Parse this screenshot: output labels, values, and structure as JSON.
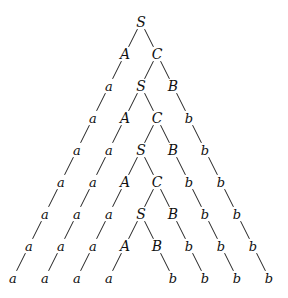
{
  "diagram": {
    "type": "parse-tree",
    "nodes": [
      {
        "id": "n0",
        "label": "S",
        "row": 0,
        "col": 0
      },
      {
        "id": "n1",
        "label": "A",
        "row": 1,
        "col": -1
      },
      {
        "id": "n2",
        "label": "C",
        "row": 1,
        "col": 1
      },
      {
        "id": "n3",
        "label": "a",
        "row": 2,
        "col": -2
      },
      {
        "id": "n4",
        "label": "S",
        "row": 2,
        "col": 0
      },
      {
        "id": "n5",
        "label": "B",
        "row": 2,
        "col": 2
      },
      {
        "id": "n6",
        "label": "a",
        "row": 3,
        "col": -3
      },
      {
        "id": "n7",
        "label": "A",
        "row": 3,
        "col": -1
      },
      {
        "id": "n8",
        "label": "C",
        "row": 3,
        "col": 1
      },
      {
        "id": "n9",
        "label": "b",
        "row": 3,
        "col": 3
      },
      {
        "id": "n10",
        "label": "a",
        "row": 4,
        "col": -4
      },
      {
        "id": "n11",
        "label": "a",
        "row": 4,
        "col": -2
      },
      {
        "id": "n12",
        "label": "S",
        "row": 4,
        "col": 0
      },
      {
        "id": "n13",
        "label": "B",
        "row": 4,
        "col": 2
      },
      {
        "id": "n14",
        "label": "b",
        "row": 4,
        "col": 4
      },
      {
        "id": "n15",
        "label": "a",
        "row": 5,
        "col": -5
      },
      {
        "id": "n16",
        "label": "a",
        "row": 5,
        "col": -3
      },
      {
        "id": "n17",
        "label": "A",
        "row": 5,
        "col": -1
      },
      {
        "id": "n18",
        "label": "C",
        "row": 5,
        "col": 1
      },
      {
        "id": "n19",
        "label": "b",
        "row": 5,
        "col": 3
      },
      {
        "id": "n20",
        "label": "b",
        "row": 5,
        "col": 5
      },
      {
        "id": "n21",
        "label": "a",
        "row": 6,
        "col": -6
      },
      {
        "id": "n22",
        "label": "a",
        "row": 6,
        "col": -4
      },
      {
        "id": "n23",
        "label": "a",
        "row": 6,
        "col": -2
      },
      {
        "id": "n24",
        "label": "S",
        "row": 6,
        "col": 0
      },
      {
        "id": "n25",
        "label": "B",
        "row": 6,
        "col": 2
      },
      {
        "id": "n26",
        "label": "b",
        "row": 6,
        "col": 4
      },
      {
        "id": "n27",
        "label": "b",
        "row": 6,
        "col": 6
      },
      {
        "id": "n28",
        "label": "a",
        "row": 7,
        "col": -7
      },
      {
        "id": "n29",
        "label": "a",
        "row": 7,
        "col": -5
      },
      {
        "id": "n30",
        "label": "a",
        "row": 7,
        "col": -3
      },
      {
        "id": "n31",
        "label": "A",
        "row": 7,
        "col": -1
      },
      {
        "id": "n32",
        "label": "B",
        "row": 7,
        "col": 1
      },
      {
        "id": "n33",
        "label": "b",
        "row": 7,
        "col": 3
      },
      {
        "id": "n34",
        "label": "b",
        "row": 7,
        "col": 5
      },
      {
        "id": "n35",
        "label": "b",
        "row": 7,
        "col": 7
      },
      {
        "id": "n36",
        "label": "a",
        "row": 8,
        "col": -8
      },
      {
        "id": "n37",
        "label": "a",
        "row": 8,
        "col": -6
      },
      {
        "id": "n38",
        "label": "a",
        "row": 8,
        "col": -4
      },
      {
        "id": "n39",
        "label": "a",
        "row": 8,
        "col": -2
      },
      {
        "id": "n40",
        "label": "b",
        "row": 8,
        "col": 2
      },
      {
        "id": "n41",
        "label": "b",
        "row": 8,
        "col": 4
      },
      {
        "id": "n42",
        "label": "b",
        "row": 8,
        "col": 6
      },
      {
        "id": "n43",
        "label": "b",
        "row": 8,
        "col": 8
      }
    ],
    "edges": [
      [
        "n0",
        "n1"
      ],
      [
        "n0",
        "n2"
      ],
      [
        "n1",
        "n3"
      ],
      [
        "n2",
        "n4"
      ],
      [
        "n2",
        "n5"
      ],
      [
        "n3",
        "n6"
      ],
      [
        "n4",
        "n7"
      ],
      [
        "n4",
        "n8"
      ],
      [
        "n5",
        "n9"
      ],
      [
        "n6",
        "n10"
      ],
      [
        "n7",
        "n11"
      ],
      [
        "n8",
        "n12"
      ],
      [
        "n8",
        "n13"
      ],
      [
        "n9",
        "n14"
      ],
      [
        "n10",
        "n15"
      ],
      [
        "n11",
        "n16"
      ],
      [
        "n12",
        "n17"
      ],
      [
        "n12",
        "n18"
      ],
      [
        "n13",
        "n19"
      ],
      [
        "n14",
        "n20"
      ],
      [
        "n15",
        "n21"
      ],
      [
        "n16",
        "n22"
      ],
      [
        "n17",
        "n23"
      ],
      [
        "n18",
        "n24"
      ],
      [
        "n18",
        "n25"
      ],
      [
        "n19",
        "n26"
      ],
      [
        "n20",
        "n27"
      ],
      [
        "n21",
        "n28"
      ],
      [
        "n22",
        "n29"
      ],
      [
        "n23",
        "n30"
      ],
      [
        "n24",
        "n31"
      ],
      [
        "n24",
        "n32"
      ],
      [
        "n25",
        "n33"
      ],
      [
        "n26",
        "n34"
      ],
      [
        "n27",
        "n35"
      ],
      [
        "n28",
        "n36"
      ],
      [
        "n29",
        "n37"
      ],
      [
        "n30",
        "n38"
      ],
      [
        "n31",
        "n39"
      ],
      [
        "n32",
        "n40"
      ],
      [
        "n33",
        "n41"
      ],
      [
        "n34",
        "n42"
      ],
      [
        "n35",
        "n43"
      ]
    ],
    "layout": {
      "root_x": 141,
      "root_y": 22,
      "row_step": 32,
      "col_step": 16
    }
  }
}
